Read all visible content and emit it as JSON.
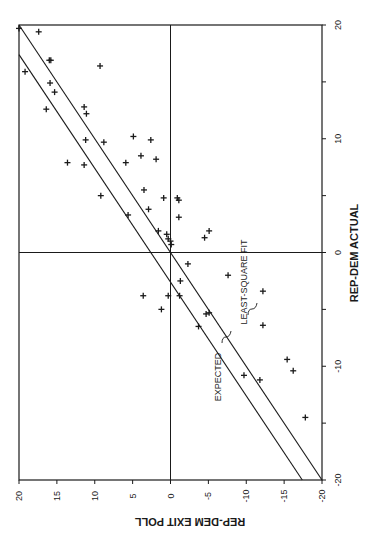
{
  "chart_data": {
    "type": "scatter",
    "title": "",
    "orientation": "figure printed rotated 90 degrees (landscape page)",
    "xlabel": "REP-DEM EXIT POLL",
    "ylabel": "REP-DEM ACTUAL",
    "xlim": [
      -20,
      20
    ],
    "ylim": [
      -20,
      20
    ],
    "x_ticks": [
      20,
      15,
      10,
      5,
      0,
      -5,
      -10,
      -15,
      -20
    ],
    "y_ticks": [
      20,
      15,
      10,
      5,
      0,
      -5,
      -10,
      -15,
      -20
    ],
    "x_tick_labels": [
      "20",
      "15",
      "10",
      "5",
      "0",
      "-5",
      "-10",
      "-15",
      "-20"
    ],
    "y_tick_labels": [
      "20",
      "10",
      "0",
      "-10",
      "-20"
    ],
    "grid": false,
    "zero_lines": true,
    "marker": "+",
    "points": [
      {
        "exit": 20.0,
        "actual": 19.7
      },
      {
        "exit": 17.4,
        "actual": 19.4
      },
      {
        "exit": 16.0,
        "actual": 16.9
      },
      {
        "exit": 15.8,
        "actual": 16.9
      },
      {
        "exit": 9.3,
        "actual": 16.4
      },
      {
        "exit": 19.2,
        "actual": 15.9
      },
      {
        "exit": 15.9,
        "actual": 14.9
      },
      {
        "exit": 15.3,
        "actual": 14.1
      },
      {
        "exit": 16.4,
        "actual": 12.6
      },
      {
        "exit": 11.4,
        "actual": 12.8
      },
      {
        "exit": 11.1,
        "actual": 12.2
      },
      {
        "exit": 11.2,
        "actual": 9.9
      },
      {
        "exit": 8.8,
        "actual": 9.7
      },
      {
        "exit": 4.9,
        "actual": 10.2
      },
      {
        "exit": 2.6,
        "actual": 9.9
      },
      {
        "exit": 13.6,
        "actual": 7.9
      },
      {
        "exit": 11.4,
        "actual": 7.7
      },
      {
        "exit": 3.9,
        "actual": 8.5
      },
      {
        "exit": 1.9,
        "actual": 8.2
      },
      {
        "exit": 5.9,
        "actual": 7.9
      },
      {
        "exit": 9.2,
        "actual": 5.0
      },
      {
        "exit": 3.5,
        "actual": 5.5
      },
      {
        "exit": -0.9,
        "actual": 4.8
      },
      {
        "exit": 0.9,
        "actual": 4.8
      },
      {
        "exit": -1.1,
        "actual": 4.6
      },
      {
        "exit": 2.9,
        "actual": 3.8
      },
      {
        "exit": 5.6,
        "actual": 3.3
      },
      {
        "exit": -1.1,
        "actual": 3.1
      },
      {
        "exit": 1.6,
        "actual": 1.9
      },
      {
        "exit": 0.5,
        "actual": 1.6
      },
      {
        "exit": 0.3,
        "actual": 1.2
      },
      {
        "exit": 0.0,
        "actual": 1.0
      },
      {
        "exit": -0.1,
        "actual": 0.7
      },
      {
        "exit": -4.5,
        "actual": 1.3
      },
      {
        "exit": -5.1,
        "actual": 1.9
      },
      {
        "exit": -2.3,
        "actual": -1.0
      },
      {
        "exit": -1.3,
        "actual": -2.5
      },
      {
        "exit": 3.6,
        "actual": -3.8
      },
      {
        "exit": 0.3,
        "actual": -3.8
      },
      {
        "exit": -1.2,
        "actual": -3.8
      },
      {
        "exit": 1.2,
        "actual": -5.0
      },
      {
        "exit": -4.7,
        "actual": -5.4
      },
      {
        "exit": -5.1,
        "actual": -5.3
      },
      {
        "exit": -3.7,
        "actual": -6.5
      },
      {
        "exit": -12.2,
        "actual": -3.4
      },
      {
        "exit": -12.2,
        "actual": -6.4
      },
      {
        "exit": -7.6,
        "actual": -2.0
      },
      {
        "exit": -15.4,
        "actual": -9.4
      },
      {
        "exit": -16.2,
        "actual": -10.4
      },
      {
        "exit": -9.7,
        "actual": -10.8
      },
      {
        "exit": -11.8,
        "actual": -11.2
      },
      {
        "exit": -17.8,
        "actual": -14.5
      }
    ],
    "lines": [
      {
        "name": "EXPECTED",
        "slope": 1.0,
        "intercept": 0.0
      },
      {
        "name": "LEAST-SQUARE FIT",
        "slope": 1.0,
        "intercept": -2.6
      }
    ],
    "annotations": [
      "EXPECTED",
      "LEAST-SQUARE FIT"
    ]
  },
  "labels": {
    "x_axis_title": "REP-DEM EXIT POLL",
    "y_axis_title": "REP-DEM ACTUAL",
    "expected": "EXPECTED",
    "lsf": "LEAST-SQUARE FIT"
  }
}
